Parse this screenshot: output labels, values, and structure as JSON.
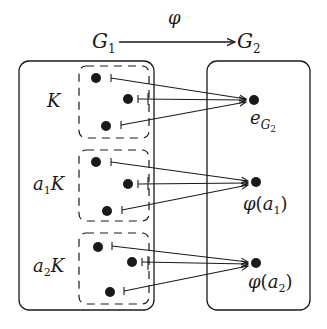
{
  "title_map": {
    "domain_label": "G",
    "domain_sub": "1",
    "codomain_label": "G",
    "codomain_sub": "2",
    "map_label": "φ"
  },
  "left_box": {
    "name": "G1",
    "cosets": [
      {
        "label_pre": "",
        "label_sub": "",
        "label_main": "K"
      },
      {
        "label_pre": "a",
        "label_sub": "1",
        "label_main": "K"
      },
      {
        "label_pre": "a",
        "label_sub": "2",
        "label_main": "K"
      }
    ]
  },
  "right_box": {
    "name": "G2",
    "targets": [
      {
        "label_main": "e",
        "label_sub": "G",
        "label_subsub": "2"
      },
      {
        "label_fn": "φ",
        "label_open": "(",
        "label_var": "a",
        "label_sub": "1",
        "label_close": ")"
      },
      {
        "label_fn": "φ",
        "label_open": "(",
        "label_var": "a",
        "label_sub": "2",
        "label_close": ")"
      }
    ]
  },
  "colors": {
    "stroke": "#1a1a1a",
    "background": "#ffffff"
  }
}
